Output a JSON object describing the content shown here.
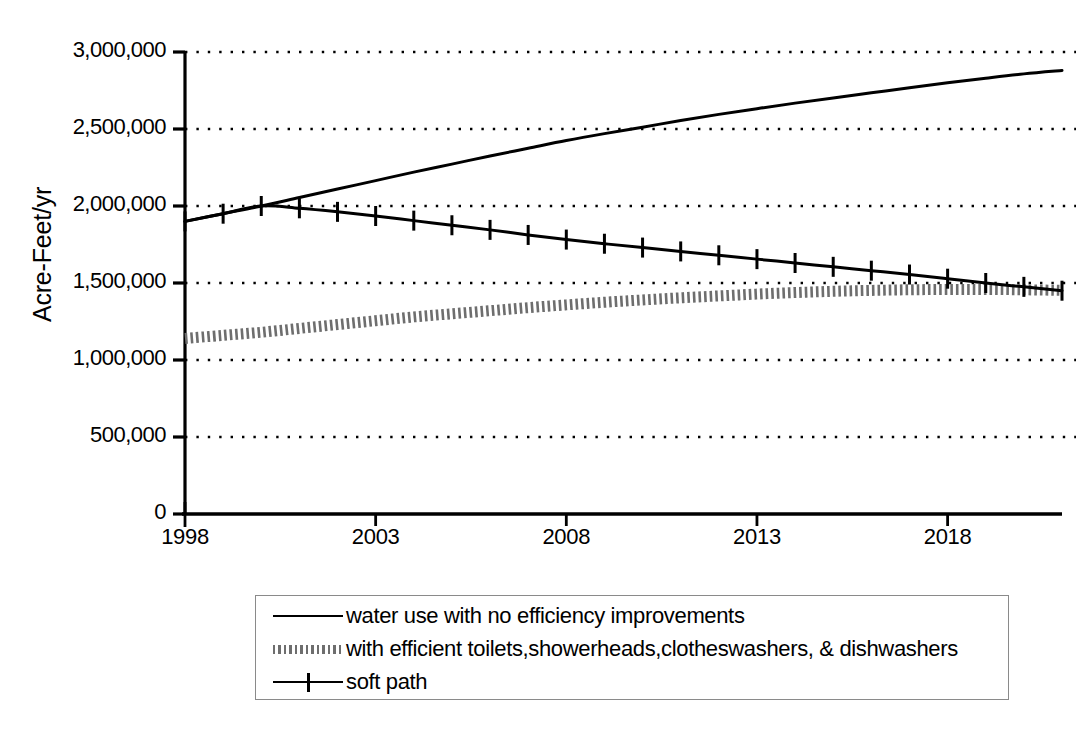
{
  "chart_data": {
    "type": "line",
    "title": "",
    "xlabel": "",
    "ylabel": "Acre-Feet/yr",
    "xlim": [
      1998,
      2021
    ],
    "ylim": [
      0,
      3000000
    ],
    "grid": true,
    "legend_position": "bottom",
    "x_ticks": [
      1998,
      2003,
      2008,
      2013,
      2018
    ],
    "y_ticks": [
      0,
      500000,
      1000000,
      1500000,
      2000000,
      2500000,
      3000000
    ],
    "y_tick_labels": [
      "0",
      "500,000",
      "1,000,000",
      "1,500,000",
      "2,000,000",
      "2,500,000",
      "3,000,000"
    ],
    "x_tick_labels": [
      "1998",
      "2003",
      "2008",
      "2013",
      "2018"
    ],
    "x": [
      1998,
      1999,
      2000,
      2001,
      2002,
      2003,
      2004,
      2005,
      2006,
      2007,
      2008,
      2009,
      2010,
      2011,
      2012,
      2013,
      2014,
      2015,
      2016,
      2017,
      2018,
      2019,
      2020,
      2021
    ],
    "series": [
      {
        "name": "water use with no efficiency improvements",
        "style": "solid",
        "color": "#000000",
        "marker": "none",
        "values": [
          1900000,
          1950000,
          2000000,
          2055000,
          2110000,
          2165000,
          2220000,
          2272000,
          2325000,
          2375000,
          2425000,
          2470000,
          2512000,
          2555000,
          2595000,
          2632000,
          2668000,
          2702000,
          2735000,
          2768000,
          2800000,
          2830000,
          2858000,
          2880000
        ]
      },
      {
        "name": "with efficient toilets,showerheads,clotheswashers, & dishwashers",
        "style": "dotted-thick",
        "color": "#6e6e6e",
        "marker": "none",
        "values": [
          1140000,
          1160000,
          1180000,
          1205000,
          1230000,
          1255000,
          1280000,
          1300000,
          1320000,
          1340000,
          1358000,
          1375000,
          1390000,
          1404000,
          1416000,
          1428000,
          1438000,
          1446000,
          1452000,
          1456000,
          1458000,
          1458000,
          1456000,
          1452000
        ]
      },
      {
        "name": "soft path",
        "style": "solid-plus",
        "color": "#000000",
        "marker": "plus",
        "values": [
          1900000,
          1950000,
          2000000,
          1985000,
          1962000,
          1935000,
          1905000,
          1875000,
          1845000,
          1812000,
          1782000,
          1755000,
          1730000,
          1705000,
          1680000,
          1655000,
          1630000,
          1605000,
          1580000,
          1555000,
          1528000,
          1500000,
          1475000,
          1450000
        ]
      }
    ]
  },
  "legend": {
    "entries": [
      {
        "label": "water use with no efficiency improvements",
        "key": "solid-line-key"
      },
      {
        "label": "with efficient toilets,showerheads,clotheswashers, & dishwashers",
        "key": "dotted-line-key"
      },
      {
        "label": "soft path",
        "key": "plus-line-key"
      }
    ]
  },
  "axes": {
    "y_title": "Acre-Feet/yr"
  }
}
